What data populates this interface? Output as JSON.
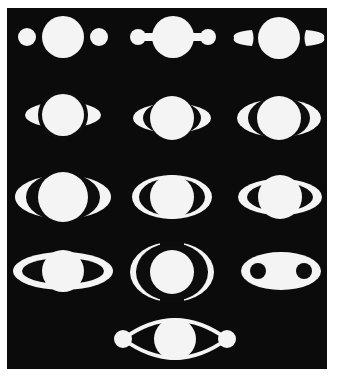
{
  "colors": {
    "background": "#ffffff",
    "panel": "#0b0b0b",
    "figure": "#f4f4f4"
  },
  "panel": {
    "x": 7,
    "y": 8,
    "width": 320,
    "height": 361
  },
  "figures": [
    {
      "id": 1,
      "type": "three-discs",
      "cx": 63,
      "cy": 37,
      "r": 21,
      "side_r": 9,
      "side_dx": 36
    },
    {
      "id": 2,
      "type": "handles",
      "cx": 173,
      "cy": 37,
      "r": 21,
      "side_r": 8,
      "side_dx": 35
    },
    {
      "id": 3,
      "type": "teardrops",
      "cx": 279,
      "cy": 38,
      "r": 21,
      "side_dx": 36
    },
    {
      "id": 4,
      "type": "half-moons",
      "cx": 63,
      "cy": 115,
      "r": 21,
      "rx": 38,
      "ry": 13
    },
    {
      "id": 5,
      "type": "ring",
      "cx": 172,
      "cy": 118,
      "r": 22,
      "rx": 39,
      "ry": 15,
      "gap_rx": 29,
      "gap_ry": 17
    },
    {
      "id": 6,
      "type": "ring",
      "cx": 279,
      "cy": 118,
      "r": 22,
      "rx": 42,
      "ry": 19,
      "gap_rx": 31,
      "gap_ry": 21
    },
    {
      "id": 7,
      "type": "ring",
      "cx": 63,
      "cy": 197,
      "r": 25,
      "rx": 48,
      "ry": 22,
      "gap_rx": 37,
      "gap_ry": 24
    },
    {
      "id": 8,
      "type": "ring",
      "cx": 172,
      "cy": 197,
      "r": 22,
      "rx": 40,
      "ry": 22,
      "gap_rx": 33,
      "gap_ry": 19
    },
    {
      "id": 9,
      "type": "ring",
      "cx": 280,
      "cy": 197,
      "r": 22,
      "rx": 42,
      "ry": 18,
      "gap_rx": 33,
      "gap_ry": 14
    },
    {
      "id": 10,
      "type": "ring",
      "cx": 63,
      "cy": 271,
      "r": 21,
      "rx": 50,
      "ry": 19,
      "gap_rx": 41,
      "gap_ry": 13
    },
    {
      "id": 11,
      "type": "double-crescent",
      "cx": 172,
      "cy": 272,
      "r": 22,
      "rx": 42,
      "ry": 30
    },
    {
      "id": 12,
      "type": "ellipse-holes",
      "cx": 281,
      "cy": 271,
      "rx": 40,
      "ry": 19,
      "hole_r": 8,
      "hole_dx": 23
    },
    {
      "id": 13,
      "type": "arcs-discs",
      "cx": 175,
      "cy": 339,
      "r": 21,
      "side_r": 9,
      "side_dx": 52
    }
  ]
}
